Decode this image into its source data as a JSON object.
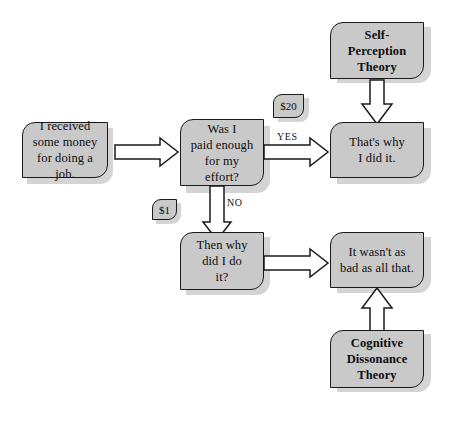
{
  "diagram": {
    "colors": {
      "box_fill": "#c9c9c9",
      "box_border": "#1a1a1a",
      "shadow": "#cdcdcd",
      "arrow_fill": "#ffffff",
      "arrow_stroke": "#1a1a1a",
      "background": "#ffffff",
      "text": "#0d0d0d"
    },
    "nodes": [
      {
        "id": "received-money",
        "type": "statement",
        "label": "I received\nsome money\nfor doing a job."
      },
      {
        "id": "paid-enough",
        "type": "statement",
        "label": "Was I\npaid enough\nfor my\neffort?"
      },
      {
        "id": "thats-why",
        "type": "statement",
        "label": "That's why\nI did it."
      },
      {
        "id": "then-why",
        "type": "statement",
        "label": "Then why\ndid I do\nit?"
      },
      {
        "id": "not-as-bad",
        "type": "statement",
        "label": "It wasn't as\nbad as all that."
      },
      {
        "id": "self-perception-theory",
        "type": "theory",
        "label": "Self-\nPerception\nTheory"
      },
      {
        "id": "cognitive-dissonance-theory",
        "type": "theory",
        "label": "Cognitive\nDissonance\nTheory"
      }
    ],
    "tags": [
      {
        "id": "tag-twenty-dollars",
        "label": "$20"
      },
      {
        "id": "tag-one-dollar",
        "label": "$1"
      }
    ],
    "edge_labels": [
      {
        "id": "edge-label-yes",
        "label": "YES"
      },
      {
        "id": "edge-label-no",
        "label": "NO"
      }
    ],
    "edges": [
      {
        "id": "edge-received-to-paid",
        "from": "received-money",
        "to": "paid-enough",
        "direction": "right",
        "label": ""
      },
      {
        "id": "edge-paid-to-thats-why",
        "from": "paid-enough",
        "to": "thats-why",
        "direction": "right",
        "label": "YES"
      },
      {
        "id": "edge-paid-to-then-why",
        "from": "paid-enough",
        "to": "then-why",
        "direction": "down",
        "label": "NO"
      },
      {
        "id": "edge-then-why-to-not-as-bad",
        "from": "then-why",
        "to": "not-as-bad",
        "direction": "right",
        "label": ""
      },
      {
        "id": "edge-self-perception-to-thats-why",
        "from": "self-perception-theory",
        "to": "thats-why",
        "direction": "down",
        "label": ""
      },
      {
        "id": "edge-cognitive-dissonance-to-not-as-bad",
        "from": "cognitive-dissonance-theory",
        "to": "not-as-bad",
        "direction": "up",
        "label": ""
      }
    ]
  }
}
